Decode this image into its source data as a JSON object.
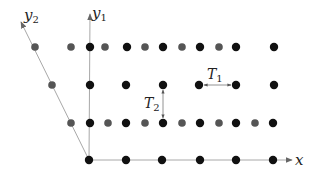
{
  "diagram": {
    "axes": {
      "origin": [
        89,
        160
      ],
      "x": {
        "label": "x",
        "end": [
          292,
          160
        ]
      },
      "y1": {
        "label": "y",
        "subscript": "1",
        "end": [
          90,
          14
        ]
      },
      "y2": {
        "label": "y",
        "subscript": "2",
        "end": [
          21,
          22
        ]
      }
    },
    "colors": {
      "black_dot": "#111111",
      "gray_dot": "#555555",
      "axis_line": "#a8a8a8",
      "arrow_head": "#666666",
      "annotation_arrow": "#777777"
    },
    "rows": [
      {
        "y": 47,
        "dots": [
          {
            "x": 35,
            "c": "gray"
          },
          {
            "x": 71,
            "c": "gray"
          },
          {
            "x": 90,
            "c": "black"
          },
          {
            "x": 105,
            "c": "gray"
          },
          {
            "x": 127,
            "c": "black"
          },
          {
            "x": 145,
            "c": "gray"
          },
          {
            "x": 163,
            "c": "black"
          },
          {
            "x": 182,
            "c": "gray"
          },
          {
            "x": 200,
            "c": "black"
          },
          {
            "x": 219,
            "c": "gray"
          },
          {
            "x": 236,
            "c": "black"
          },
          {
            "x": 274,
            "c": "black"
          }
        ]
      },
      {
        "y": 85,
        "dots": [
          {
            "x": 52,
            "c": "gray"
          },
          {
            "x": 90,
            "c": "black"
          },
          {
            "x": 126,
            "c": "black"
          },
          {
            "x": 163,
            "c": "black"
          },
          {
            "x": 199,
            "c": "black"
          },
          {
            "x": 236,
            "c": "black"
          },
          {
            "x": 274,
            "c": "black"
          }
        ]
      },
      {
        "y": 123,
        "dots": [
          {
            "x": 71,
            "c": "gray"
          },
          {
            "x": 90,
            "c": "black"
          },
          {
            "x": 108,
            "c": "gray"
          },
          {
            "x": 126,
            "c": "black"
          },
          {
            "x": 145,
            "c": "gray"
          },
          {
            "x": 163,
            "c": "black"
          },
          {
            "x": 182,
            "c": "gray"
          },
          {
            "x": 200,
            "c": "black"
          },
          {
            "x": 219,
            "c": "gray"
          },
          {
            "x": 236,
            "c": "black"
          },
          {
            "x": 255,
            "c": "gray"
          },
          {
            "x": 273,
            "c": "black"
          }
        ]
      },
      {
        "y": 160,
        "dots": [
          {
            "x": 89,
            "c": "black"
          },
          {
            "x": 126,
            "c": "black"
          },
          {
            "x": 162,
            "c": "black"
          },
          {
            "x": 200,
            "c": "black"
          },
          {
            "x": 236,
            "c": "black"
          },
          {
            "x": 273,
            "c": "black"
          }
        ]
      }
    ],
    "annotations": {
      "T1": {
        "label": "T",
        "subscript": "1",
        "from": [
          199,
          85
        ],
        "to": [
          236,
          85
        ],
        "label_pos": [
          207,
          80
        ]
      },
      "T2": {
        "label": "T",
        "subscript": "2",
        "from": [
          163,
          85
        ],
        "to": [
          163,
          123
        ],
        "label_pos": [
          144,
          108
        ]
      }
    }
  }
}
